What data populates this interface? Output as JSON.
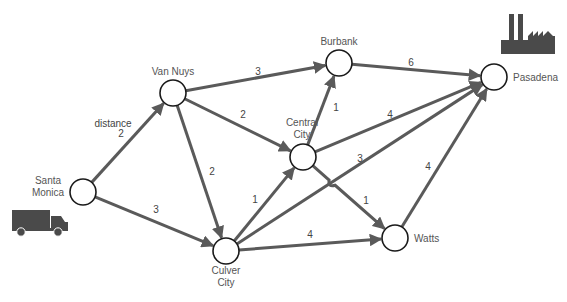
{
  "diagram": {
    "colors": {
      "edge": "#5a5a5a",
      "node_stroke": "#1a1a1a",
      "node_fill": "#ffffff",
      "text": "#555555",
      "icon": "#4a4a4a"
    },
    "node_radius": 13,
    "nodes": [
      {
        "id": "santa-monica",
        "label": [
          "Santa",
          "Monica"
        ],
        "x": 83,
        "y": 192,
        "label_x": 48,
        "label_y": 184,
        "anchor": "middle"
      },
      {
        "id": "van-nuys",
        "label": [
          "Van Nuys"
        ],
        "x": 173,
        "y": 93,
        "label_x": 173,
        "label_y": 75,
        "anchor": "middle"
      },
      {
        "id": "burbank",
        "label": [
          "Burbank"
        ],
        "x": 339,
        "y": 63,
        "label_x": 339,
        "label_y": 45,
        "anchor": "middle"
      },
      {
        "id": "central-city",
        "label": [
          "Central",
          "City"
        ],
        "x": 303,
        "y": 157,
        "label_x": 302,
        "label_y": 126,
        "anchor": "middle"
      },
      {
        "id": "culver-city",
        "label": [
          "Culver",
          "City"
        ],
        "x": 226,
        "y": 251,
        "label_x": 226,
        "label_y": 274,
        "anchor": "middle"
      },
      {
        "id": "watts",
        "label": [
          "Watts"
        ],
        "x": 395,
        "y": 238,
        "label_x": 414,
        "label_y": 242,
        "anchor": "start"
      },
      {
        "id": "pasadena",
        "label": [
          "Pasadena"
        ],
        "x": 494,
        "y": 77,
        "label_x": 513,
        "label_y": 81,
        "anchor": "start"
      }
    ],
    "edges": [
      {
        "from": "santa-monica",
        "to": "van-nuys",
        "weight": "2",
        "label_x": 121,
        "label_y": 137,
        "extra_label": "distance",
        "extra_x": 113,
        "extra_y": 127
      },
      {
        "from": "santa-monica",
        "to": "culver-city",
        "weight": "3",
        "label_x": 156,
        "label_y": 213
      },
      {
        "from": "van-nuys",
        "to": "burbank",
        "weight": "3",
        "label_x": 258,
        "label_y": 75
      },
      {
        "from": "van-nuys",
        "to": "central-city",
        "weight": "2",
        "label_x": 243,
        "label_y": 118
      },
      {
        "from": "van-nuys",
        "to": "culver-city",
        "weight": "2",
        "label_x": 212,
        "label_y": 175
      },
      {
        "from": "burbank",
        "to": "pasadena",
        "weight": "6",
        "label_x": 411,
        "label_y": 66
      },
      {
        "from": "central-city",
        "to": "burbank",
        "weight": "1",
        "label_x": 336,
        "label_y": 111
      },
      {
        "from": "central-city",
        "to": "pasadena",
        "weight": "4",
        "label_x": 390,
        "label_y": 118
      },
      {
        "from": "central-city",
        "to": "watts",
        "weight": "1",
        "label_x": 366,
        "label_y": 204,
        "bump": true
      },
      {
        "from": "culver-city",
        "to": "central-city",
        "weight": "1",
        "label_x": 255,
        "label_y": 203
      },
      {
        "from": "culver-city",
        "to": "pasadena",
        "weight": "3",
        "label_x": 360,
        "label_y": 162
      },
      {
        "from": "culver-city",
        "to": "watts",
        "weight": "4",
        "label_x": 310,
        "label_y": 238
      },
      {
        "from": "watts",
        "to": "pasadena",
        "weight": "4",
        "label_x": 428,
        "label_y": 170
      }
    ],
    "icons": [
      {
        "name": "truck-icon",
        "x": 12,
        "y": 210
      },
      {
        "name": "factory-icon",
        "x": 499,
        "y": 14
      }
    ]
  }
}
